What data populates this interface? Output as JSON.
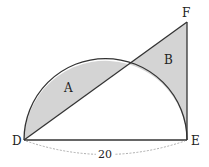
{
  "diagram": {
    "points": {
      "D": "D",
      "E": "E",
      "F": "F"
    },
    "regions": {
      "A": "A",
      "B": "B"
    },
    "dimension_label": "20",
    "colors": {
      "stroke": "#333333",
      "shade": "#d4d4d4",
      "dim": "#999999"
    }
  }
}
